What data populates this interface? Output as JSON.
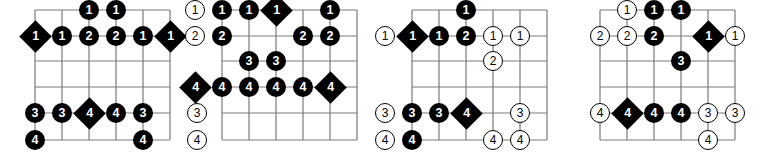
{
  "page": {
    "diagram_count": 4,
    "colors": {
      "grid_line": "#7a7a7a",
      "marker_fill": "#000000",
      "marker_text": "#ffffff",
      "hollow_fill": "#ffffff",
      "hollow_stroke": "#000000",
      "background": "#ffffff"
    }
  },
  "chart_data": {
    "type": "table",
    "xlabel": "Fret position",
    "ylabel": "String",
    "legend": [
      {
        "style": "circle",
        "meaning": "scale tone, filled circle with finger number"
      },
      {
        "style": "diamond",
        "meaning": "root note, filled diamond with finger number"
      },
      {
        "style": "hollow",
        "meaning": "hollow circle with finger number"
      }
    ],
    "grid": {
      "strings": 6,
      "fret_lines": 6,
      "string_rows": [
        0,
        1,
        2,
        3,
        4,
        5
      ],
      "fret_cols": [
        0,
        1,
        2,
        3,
        4,
        5
      ]
    },
    "diagrams": [
      {
        "name": "diagram-1",
        "index": 1,
        "markers": [
          {
            "string": 0,
            "fret": 2,
            "label": "1",
            "style": "circle"
          },
          {
            "string": 0,
            "fret": 3,
            "label": "1",
            "style": "circle"
          },
          {
            "string": 1,
            "fret": 0,
            "label": "1",
            "style": "diamond"
          },
          {
            "string": 1,
            "fret": 1,
            "label": "1",
            "style": "circle"
          },
          {
            "string": 1,
            "fret": 2,
            "label": "2",
            "style": "circle"
          },
          {
            "string": 1,
            "fret": 3,
            "label": "2",
            "style": "circle"
          },
          {
            "string": 1,
            "fret": 4,
            "label": "1",
            "style": "circle"
          },
          {
            "string": 1,
            "fret": 5,
            "label": "1",
            "style": "diamond"
          },
          {
            "string": 4,
            "fret": 0,
            "label": "3",
            "style": "circle"
          },
          {
            "string": 4,
            "fret": 1,
            "label": "3",
            "style": "circle"
          },
          {
            "string": 4,
            "fret": 2,
            "label": "4",
            "style": "diamond"
          },
          {
            "string": 4,
            "fret": 3,
            "label": "4",
            "style": "circle"
          },
          {
            "string": 4,
            "fret": 4,
            "label": "3",
            "style": "circle"
          },
          {
            "string": 4,
            "fret": 6,
            "label": "3",
            "style": "hollow"
          },
          {
            "string": 5,
            "fret": 0,
            "label": "4",
            "style": "circle"
          },
          {
            "string": 5,
            "fret": 4,
            "label": "4",
            "style": "circle"
          },
          {
            "string": 5,
            "fret": 6,
            "label": "4",
            "style": "hollow"
          }
        ]
      },
      {
        "name": "diagram-2",
        "index": 2,
        "markers": [
          {
            "string": 0,
            "fret": -1,
            "label": "1",
            "style": "hollow"
          },
          {
            "string": 0,
            "fret": 0,
            "label": "1",
            "style": "circle"
          },
          {
            "string": 0,
            "fret": 1,
            "label": "1",
            "style": "circle"
          },
          {
            "string": 0,
            "fret": 2,
            "label": "1",
            "style": "diamond"
          },
          {
            "string": 0,
            "fret": 4,
            "label": "1",
            "style": "circle"
          },
          {
            "string": 1,
            "fret": -1,
            "label": "2",
            "style": "hollow"
          },
          {
            "string": 1,
            "fret": 0,
            "label": "2",
            "style": "circle"
          },
          {
            "string": 1,
            "fret": 3,
            "label": "2",
            "style": "circle"
          },
          {
            "string": 1,
            "fret": 4,
            "label": "2",
            "style": "circle"
          },
          {
            "string": 2,
            "fret": 1,
            "label": "3",
            "style": "circle"
          },
          {
            "string": 2,
            "fret": 2,
            "label": "3",
            "style": "circle"
          },
          {
            "string": 3,
            "fret": -1,
            "label": "4",
            "style": "diamond"
          },
          {
            "string": 3,
            "fret": 0,
            "label": "4",
            "style": "circle"
          },
          {
            "string": 3,
            "fret": 1,
            "label": "4",
            "style": "circle"
          },
          {
            "string": 3,
            "fret": 2,
            "label": "4",
            "style": "circle"
          },
          {
            "string": 3,
            "fret": 3,
            "label": "4",
            "style": "circle"
          },
          {
            "string": 3,
            "fret": 4,
            "label": "4",
            "style": "diamond"
          }
        ]
      },
      {
        "name": "diagram-3",
        "index": 3,
        "markers": [
          {
            "string": 0,
            "fret": 2,
            "label": "1",
            "style": "circle"
          },
          {
            "string": 1,
            "fret": -1,
            "label": "1",
            "style": "hollow"
          },
          {
            "string": 1,
            "fret": 0,
            "label": "1",
            "style": "diamond"
          },
          {
            "string": 1,
            "fret": 1,
            "label": "1",
            "style": "circle"
          },
          {
            "string": 1,
            "fret": 2,
            "label": "2",
            "style": "circle"
          },
          {
            "string": 1,
            "fret": 3,
            "label": "1",
            "style": "hollow"
          },
          {
            "string": 1,
            "fret": 4,
            "label": "1",
            "style": "hollow"
          },
          {
            "string": 2,
            "fret": 3,
            "label": "2",
            "style": "hollow"
          },
          {
            "string": 4,
            "fret": -1,
            "label": "3",
            "style": "hollow"
          },
          {
            "string": 4,
            "fret": 0,
            "label": "3",
            "style": "circle"
          },
          {
            "string": 4,
            "fret": 1,
            "label": "3",
            "style": "circle"
          },
          {
            "string": 4,
            "fret": 2,
            "label": "4",
            "style": "diamond"
          },
          {
            "string": 4,
            "fret": 4,
            "label": "3",
            "style": "hollow"
          },
          {
            "string": 5,
            "fret": -1,
            "label": "4",
            "style": "hollow"
          },
          {
            "string": 5,
            "fret": 0,
            "label": "4",
            "style": "circle"
          },
          {
            "string": 5,
            "fret": 3,
            "label": "4",
            "style": "hollow"
          },
          {
            "string": 5,
            "fret": 4,
            "label": "4",
            "style": "hollow"
          }
        ]
      },
      {
        "name": "diagram-4",
        "index": 4,
        "markers": [
          {
            "string": 0,
            "fret": 1,
            "label": "1",
            "style": "hollow"
          },
          {
            "string": 0,
            "fret": 2,
            "label": "1",
            "style": "circle"
          },
          {
            "string": 0,
            "fret": 3,
            "label": "1",
            "style": "circle"
          },
          {
            "string": 1,
            "fret": 0,
            "label": "2",
            "style": "hollow"
          },
          {
            "string": 1,
            "fret": 1,
            "label": "2",
            "style": "hollow"
          },
          {
            "string": 1,
            "fret": 2,
            "label": "2",
            "style": "circle"
          },
          {
            "string": 1,
            "fret": 4,
            "label": "1",
            "style": "diamond"
          },
          {
            "string": 1,
            "fret": 5,
            "label": "1",
            "style": "hollow"
          },
          {
            "string": 2,
            "fret": 3,
            "label": "3",
            "style": "circle"
          },
          {
            "string": 4,
            "fret": 0,
            "label": "4",
            "style": "hollow"
          },
          {
            "string": 4,
            "fret": 1,
            "label": "4",
            "style": "diamond"
          },
          {
            "string": 4,
            "fret": 2,
            "label": "4",
            "style": "circle"
          },
          {
            "string": 4,
            "fret": 3,
            "label": "4",
            "style": "circle"
          },
          {
            "string": 4,
            "fret": 4,
            "label": "3",
            "style": "hollow"
          },
          {
            "string": 4,
            "fret": 5,
            "label": "3",
            "style": "hollow"
          },
          {
            "string": 5,
            "fret": 4,
            "label": "4",
            "style": "hollow"
          }
        ]
      }
    ]
  }
}
